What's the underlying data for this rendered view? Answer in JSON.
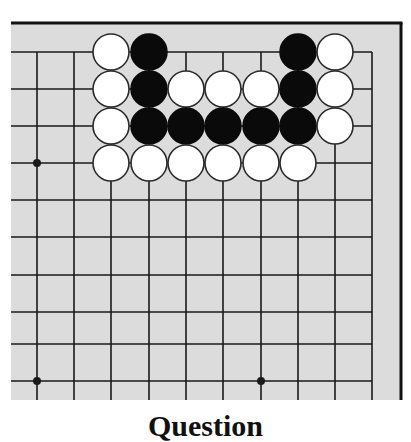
{
  "board": {
    "background": "#dcdcdc",
    "line_color": "#1a1a1a",
    "frame_color": "#111111",
    "area": {
      "left": 11,
      "top": 23,
      "right": 401,
      "bottom": 400
    },
    "grid_x": [
      37,
      74,
      111,
      149,
      186,
      223,
      261,
      298,
      335,
      372
    ],
    "grid_y": [
      52,
      89,
      126,
      163,
      200,
      237,
      275,
      312,
      344,
      381
    ],
    "open_edges": [
      "left",
      "bottom"
    ],
    "framed_edges": [
      "top",
      "right"
    ],
    "hoshi": [
      [
        0,
        3
      ],
      [
        0,
        9
      ],
      [
        6,
        9
      ]
    ],
    "stone_radius": 18,
    "stones": [
      {
        "col": 2,
        "row": 0,
        "color": "white"
      },
      {
        "col": 3,
        "row": 0,
        "color": "black"
      },
      {
        "col": 7,
        "row": 0,
        "color": "black"
      },
      {
        "col": 8,
        "row": 0,
        "color": "white"
      },
      {
        "col": 2,
        "row": 1,
        "color": "white"
      },
      {
        "col": 3,
        "row": 1,
        "color": "black"
      },
      {
        "col": 4,
        "row": 1,
        "color": "white"
      },
      {
        "col": 5,
        "row": 1,
        "color": "white"
      },
      {
        "col": 6,
        "row": 1,
        "color": "white"
      },
      {
        "col": 7,
        "row": 1,
        "color": "black"
      },
      {
        "col": 8,
        "row": 1,
        "color": "white"
      },
      {
        "col": 2,
        "row": 2,
        "color": "white"
      },
      {
        "col": 3,
        "row": 2,
        "color": "black"
      },
      {
        "col": 4,
        "row": 2,
        "color": "black"
      },
      {
        "col": 5,
        "row": 2,
        "color": "black"
      },
      {
        "col": 6,
        "row": 2,
        "color": "black"
      },
      {
        "col": 7,
        "row": 2,
        "color": "black"
      },
      {
        "col": 8,
        "row": 2,
        "color": "white"
      },
      {
        "col": 2,
        "row": 3,
        "color": "white"
      },
      {
        "col": 3,
        "row": 3,
        "color": "white"
      },
      {
        "col": 4,
        "row": 3,
        "color": "white"
      },
      {
        "col": 5,
        "row": 3,
        "color": "white"
      },
      {
        "col": 6,
        "row": 3,
        "color": "white"
      },
      {
        "col": 7,
        "row": 3,
        "color": "white"
      }
    ]
  },
  "caption": "Question"
}
